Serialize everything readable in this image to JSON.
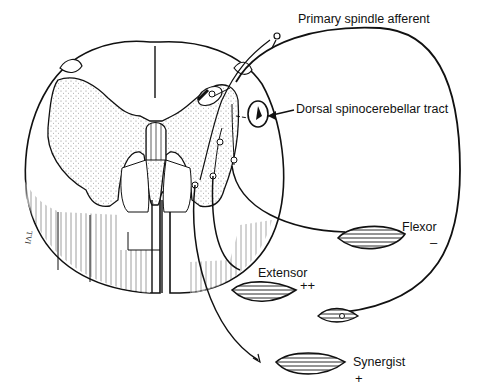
{
  "diagram": {
    "labels": {
      "primary_afferent": "Primary spindle afferent",
      "dorsal_tract": "Dorsal spinocerebellar tract",
      "flexor": "Flexor",
      "flexor_sign": "–",
      "extensor": "Extensor",
      "extensor_sign": "++",
      "synergist": "Synergist",
      "synergist_sign": "+",
      "artist_initials": "TVI"
    },
    "colors": {
      "ink": "#111111",
      "stipple": "#9a9a9a",
      "background": "#ffffff"
    }
  }
}
